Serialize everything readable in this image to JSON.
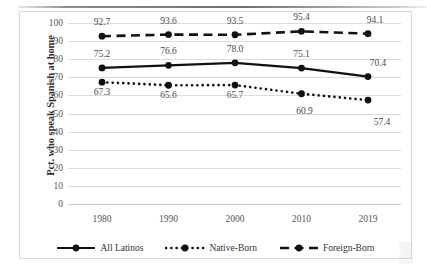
{
  "chart_data": {
    "type": "line",
    "title": "",
    "xlabel": "",
    "ylabel": "Pct. who speak Spanish at home",
    "categories": [
      "1980",
      "1990",
      "2000",
      "2010",
      "2019"
    ],
    "ylim": [
      0,
      100
    ],
    "ytick_step": 10,
    "yticks": [
      "100",
      "90",
      "80",
      "70",
      "60",
      "50",
      "40",
      "30",
      "20",
      "10",
      "0"
    ],
    "grid": true,
    "legend_position": "bottom",
    "series": [
      {
        "name": "All Latinos",
        "style": "solid",
        "color": "#111111",
        "values": [
          75.2,
          76.6,
          78.0,
          75.1,
          70.4
        ],
        "labels": [
          "75.2",
          "76.6",
          "78.0",
          "75.1",
          "70.4"
        ]
      },
      {
        "name": "Native-Born",
        "style": "dotted",
        "color": "#111111",
        "values": [
          67.3,
          65.6,
          65.7,
          60.9,
          57.4
        ],
        "labels": [
          "67.3",
          "65.6",
          "65.7",
          "60.9",
          "57.4"
        ]
      },
      {
        "name": "Foreign-Born",
        "style": "dashed",
        "color": "#111111",
        "values": [
          92.7,
          93.6,
          93.5,
          95.4,
          94.1
        ],
        "labels": [
          "92.7",
          "93.6",
          "93.5",
          "95.4",
          "94.1"
        ]
      }
    ]
  },
  "legend": {
    "items": [
      {
        "label": "All Latinos"
      },
      {
        "label": "Native-Born"
      },
      {
        "label": "Foreign-Born"
      }
    ]
  }
}
